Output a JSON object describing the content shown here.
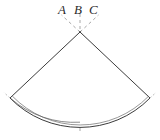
{
  "figure": {
    "type": "geometry-diagram",
    "background_color": "#ffffff",
    "stroke_color": "#3a3a3a",
    "dash_color": "#9a9a9a",
    "labels": [
      {
        "id": "A",
        "text": "A",
        "x": 58,
        "y": 3
      },
      {
        "id": "B",
        "text": "B",
        "x": 74,
        "y": 3
      },
      {
        "id": "C",
        "text": "C",
        "x": 89,
        "y": 3
      }
    ],
    "geometry": {
      "apex": {
        "x": 80,
        "y": 32
      },
      "arc_left_endpoint": {
        "x": 10,
        "y": 98
      },
      "arc_right_endpoint": {
        "x": 150,
        "y": 98
      },
      "arc_bottom_point": {
        "x": 80,
        "y": 122
      },
      "inner_arc_offset": 2.5,
      "radius": 96,
      "sector_half_angle_deg": 46,
      "axis_line": {
        "x1": 80,
        "y1": 16,
        "x2": 80,
        "y2": 132
      },
      "ray_a": {
        "x1": 80,
        "y1": 32,
        "x2": 62,
        "y2": 16
      },
      "ray_b": {
        "x1": 80,
        "y1": 32,
        "x2": 80,
        "y2": 16
      },
      "ray_c": {
        "x1": 80,
        "y1": 32,
        "x2": 98,
        "y2": 16
      }
    }
  }
}
